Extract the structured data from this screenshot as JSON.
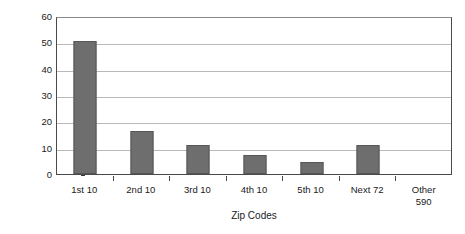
{
  "chart_data": {
    "type": "bar",
    "title": "",
    "subtitle": "",
    "xlabel": "Zip Codes",
    "ylabel": "Percent of MA Phase I Awards",
    "categories": [
      "1st 10",
      "2nd 10",
      "3rd 10",
      "4th 10",
      "5th 10",
      "Next 72",
      "Other 590"
    ],
    "category_lines": [
      [
        "1st 10"
      ],
      [
        "2nd 10"
      ],
      [
        "3rd 10"
      ],
      [
        "4th 10"
      ],
      [
        "5th 10"
      ],
      [
        "Next 72"
      ],
      [
        "Other",
        "590"
      ]
    ],
    "values": [
      50.5,
      16.2,
      11.2,
      7.2,
      4.7,
      11.0,
      0
    ],
    "ylim": [
      0,
      60
    ],
    "yticks": [
      0,
      10,
      20,
      30,
      40,
      50,
      60
    ],
    "ytick_labels": [
      "0",
      "10",
      "20",
      "30",
      "40",
      "50",
      "60"
    ],
    "grid": true,
    "grid_axis": "y",
    "legend": false,
    "legend_position": "none",
    "bar_color": "#6e6e6e",
    "bar_border_color": "#565656",
    "gridline_color": "#b9b9b9",
    "axis_color": "#4a4a4a",
    "background_color": "#ffffff"
  }
}
